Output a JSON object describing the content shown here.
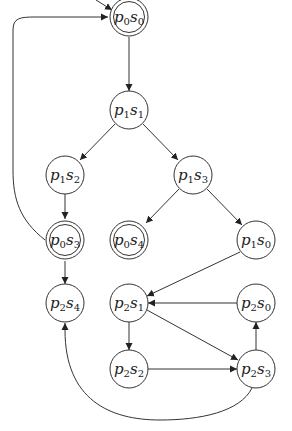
{
  "diagram": {
    "type": "state-transition-graph",
    "nodes": [
      {
        "id": "p0s0",
        "p": "p",
        "pi": "0",
        "s": "s",
        "si": "0",
        "x": 129,
        "y": 17,
        "accepting": true,
        "initial": true
      },
      {
        "id": "p1s1",
        "p": "p",
        "pi": "1",
        "s": "s",
        "si": "1",
        "x": 129,
        "y": 110,
        "accepting": false
      },
      {
        "id": "p1s2",
        "p": "p",
        "pi": "1",
        "s": "s",
        "si": "2",
        "x": 65,
        "y": 175,
        "accepting": false
      },
      {
        "id": "p1s3",
        "p": "p",
        "pi": "1",
        "s": "s",
        "si": "3",
        "x": 193,
        "y": 175,
        "accepting": false
      },
      {
        "id": "p0s3",
        "p": "p",
        "pi": "0",
        "s": "s",
        "si": "3",
        "x": 65,
        "y": 240,
        "accepting": true
      },
      {
        "id": "p0s4",
        "p": "p",
        "pi": "0",
        "s": "s",
        "si": "4",
        "x": 129,
        "y": 240,
        "accepting": true
      },
      {
        "id": "p1s0",
        "p": "p",
        "pi": "1",
        "s": "s",
        "si": "0",
        "x": 256,
        "y": 240,
        "accepting": false
      },
      {
        "id": "p2s4",
        "p": "p",
        "pi": "2",
        "s": "s",
        "si": "4",
        "x": 65,
        "y": 303,
        "accepting": false
      },
      {
        "id": "p2s1",
        "p": "p",
        "pi": "2",
        "s": "s",
        "si": "1",
        "x": 129,
        "y": 303,
        "accepting": false
      },
      {
        "id": "p2s0",
        "p": "p",
        "pi": "2",
        "s": "s",
        "si": "0",
        "x": 256,
        "y": 303,
        "accepting": false
      },
      {
        "id": "p2s2",
        "p": "p",
        "pi": "2",
        "s": "s",
        "si": "2",
        "x": 129,
        "y": 369,
        "accepting": false
      },
      {
        "id": "p2s3",
        "p": "p",
        "pi": "2",
        "s": "s",
        "si": "3",
        "x": 256,
        "y": 369,
        "accepting": false
      }
    ],
    "edges": [
      {
        "from": "start",
        "to": "p0s0"
      },
      {
        "from": "p0s0",
        "to": "p1s1"
      },
      {
        "from": "p1s1",
        "to": "p1s2"
      },
      {
        "from": "p1s1",
        "to": "p1s3"
      },
      {
        "from": "p1s2",
        "to": "p0s3"
      },
      {
        "from": "p0s3",
        "to": "p0s0"
      },
      {
        "from": "p0s3",
        "to": "p2s4"
      },
      {
        "from": "p1s3",
        "to": "p0s4"
      },
      {
        "from": "p1s3",
        "to": "p1s0"
      },
      {
        "from": "p1s0",
        "to": "p2s1"
      },
      {
        "from": "p2s0",
        "to": "p2s1"
      },
      {
        "from": "p2s1",
        "to": "p2s2"
      },
      {
        "from": "p2s1",
        "to": "p2s3"
      },
      {
        "from": "p2s2",
        "to": "p2s3"
      },
      {
        "from": "p2s3",
        "to": "p2s0"
      },
      {
        "from": "p2s3",
        "to": "p2s4"
      }
    ]
  }
}
